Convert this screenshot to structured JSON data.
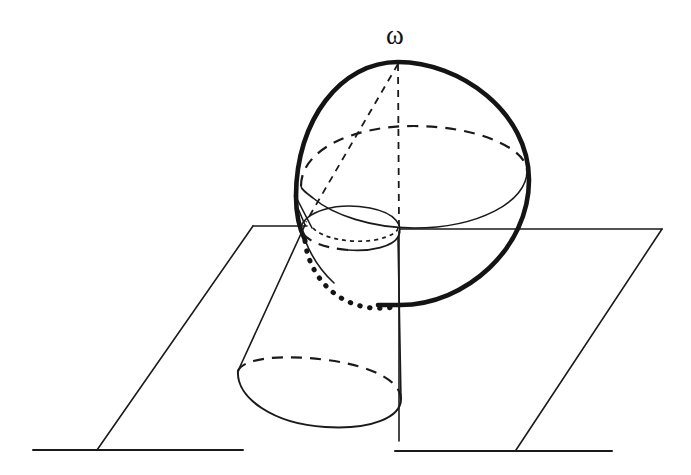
{
  "figure": {
    "background_color": "#ffffff",
    "ink_color": "#1a1a1a",
    "canvas": {
      "width": 691,
      "height": 475
    }
  },
  "labels": {
    "apex": {
      "text": "ω",
      "name": "omega",
      "x": 386,
      "y": 22,
      "font_size": 27
    }
  },
  "elements": {
    "plane": {
      "name": "ground-plane",
      "corner_top_left": [
        253,
        227
      ],
      "corner_top_right": [
        662,
        229
      ],
      "corner_bottom_right": [
        516,
        450
      ],
      "corner_bottom_left": [
        97,
        450
      ],
      "baseline_left": [
        33,
        450
      ],
      "baseline_right": [
        612,
        450
      ]
    },
    "sphere": {
      "name": "sphere",
      "center": [
        399,
        184
      ],
      "radius_x": 131,
      "radius_y": 121,
      "top": [
        398,
        62
      ],
      "bottom": [
        400,
        305
      ],
      "left": [
        296,
        190
      ],
      "right": [
        529,
        172
      ]
    },
    "equator": {
      "name": "equator-ellipse",
      "center": [
        412,
        175
      ],
      "radius_x": 116,
      "radius_y": 50,
      "rotation_deg": -5,
      "back_half": "dashed",
      "front_half": "solid"
    },
    "cone": {
      "name": "cone",
      "apex": [
        398,
        62
      ],
      "top_ellipse": {
        "center": [
          348,
          233
        ],
        "radius_x": 52,
        "radius_y": 25,
        "rotation_deg": -10
      },
      "base_ellipse": {
        "center": [
          320,
          386
        ],
        "radius_x": 83,
        "radius_y": 43,
        "rotation_deg": -8
      },
      "intersection_curve": "dotted"
    },
    "axis": {
      "name": "vertical-axis",
      "from": [
        398,
        62
      ],
      "to": [
        399,
        441
      ],
      "style": "dashed"
    }
  },
  "colors": {
    "ink": "#1a1a1a",
    "heavy_ink": "#141414",
    "paper": "#ffffff"
  }
}
